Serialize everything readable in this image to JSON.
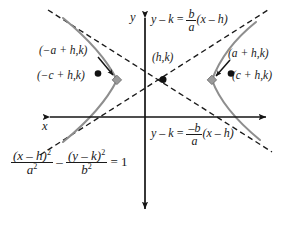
{
  "figure": {
    "type": "conic-section-diagram",
    "background_color": "#ffffff",
    "ink_color": "#1a1a1a",
    "curve_color": "#8c8c8c"
  },
  "axes": {
    "y_axis_label": "y",
    "x_axis_label": "x",
    "origin_px": {
      "x": 145,
      "y": 117
    },
    "y_axis": {
      "x": 145,
      "top": 12,
      "bottom": 215,
      "arrows": "both"
    },
    "x_axis": {
      "y": 117,
      "left": 44,
      "right": 272,
      "arrows": "both"
    }
  },
  "points": {
    "center": {
      "label": "(h,k)",
      "px": {
        "x": 163,
        "y": 79
      },
      "marker": "filled-dot"
    },
    "left_vertex": {
      "label": "(−a + h,k)",
      "px": {
        "x": 117,
        "y": 80
      },
      "marker": "diamond"
    },
    "left_focus": {
      "label": "(−c + h,k)",
      "px": {
        "x": 98,
        "y": 74
      },
      "marker": "filled-dot"
    },
    "right_vertex": {
      "label": "(a + h,k)",
      "px": {
        "x": 212,
        "y": 80
      },
      "marker": "diamond"
    },
    "right_focus": {
      "label": "(c + h,k)",
      "px": {
        "x": 231,
        "y": 74
      },
      "marker": "filled-dot"
    }
  },
  "labels": {
    "left_vertex_text": "(−a + h,k)",
    "left_focus_text": "(−c + h,k)",
    "center_text": "(h,k)",
    "right_vertex_text": "(a + h,k)",
    "right_focus_text": "(c + h,k)"
  },
  "equations": {
    "asymptote_positive": {
      "lhs_var_y": "y",
      "minus": "–",
      "lhs_var_k": "k",
      "equals": "=",
      "numerator": "b",
      "denominator": "a",
      "factor": "(x – h)",
      "plain": "y – k = (b/a)(x – h)",
      "slope_sign": "positive"
    },
    "asymptote_negative": {
      "lhs_var_y": "y",
      "minus": "–",
      "lhs_var_k": "k",
      "equals": "=",
      "numerator": "–b",
      "denominator": "a",
      "factor": "(x – h)",
      "plain": "y – k = (–b/a)(x – h)",
      "slope_sign": "negative"
    },
    "standard_form": {
      "num1": "(x – h)",
      "num1_exp": "2",
      "den1": "a",
      "den1_exp": "2",
      "operator": "–",
      "num2": "(y – k)",
      "num2_exp": "2",
      "den2": "b",
      "den2_exp": "2",
      "equals": "= 1",
      "plain": "(x – h)²/a² – (y – k)²/b² = 1"
    }
  },
  "annotations": {
    "left_arrow_from": "(−a + h,k) label",
    "left_arrow_to": "left vertex marker",
    "right_arrow_from": "(a + h,k) label",
    "right_arrow_to": "right vertex marker"
  }
}
